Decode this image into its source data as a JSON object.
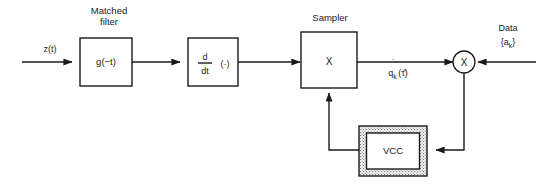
{
  "diagram": {
    "background_color": "#ffffff",
    "line_color": "#1a1a1a",
    "input": {
      "label": "z(t)"
    },
    "blocks": [
      {
        "id": "matched-filter",
        "caption": "Matched",
        "caption_line2": "filter",
        "inner_label": "g(−t)"
      },
      {
        "id": "differentiator",
        "numerator": "d",
        "denominator": "dt",
        "operand": "(·)"
      },
      {
        "id": "sampler",
        "caption": "Sampler",
        "inner_label": "X"
      },
      {
        "id": "vcc",
        "inner_label": "VCC"
      }
    ],
    "multiplier": {
      "id": "multiplier",
      "symbol": "X"
    },
    "signals": {
      "sampler_output_base": "q",
      "sampler_output_sub": "k",
      "sampler_output_arg": "(τ̂)",
      "sampler_output_full": "q̇ₖ(τ̂)"
    },
    "data_input": {
      "label": "Data",
      "sequence": "{a",
      "sequence_sub": "k",
      "sequence_close": "}",
      "sequence_full": "{aₖ}"
    }
  }
}
